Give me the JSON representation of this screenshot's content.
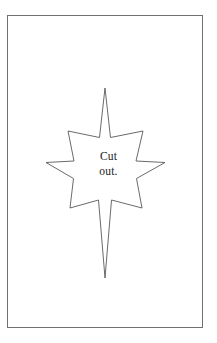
{
  "page": {
    "width": 217,
    "height": 343,
    "background_color": "#ffffff",
    "border_color": "#6f7072"
  },
  "frame": {
    "name": "page-border",
    "left": 7,
    "top": 15,
    "width": 196,
    "height": 313
  },
  "star": {
    "icon_name": "eight-pointed-bethlehem-star",
    "outline_color": "#58595b",
    "fill_color": "#ffffff",
    "stroke_width": 0.9,
    "center_x": 105,
    "center_y": 170,
    "top_tip_y": 88,
    "bottom_tip_y": 278,
    "left_tip_x": 46,
    "right_tip_x": 165,
    "points": 8,
    "path": "M105,88 L110.5,137.5 L143,131 L136,161 L165,162.5 L136.5,178.5 L142,208 L111.5,200 L105,278 L98.5,200 L70,208 L73.5,178.5 L46,162.5 L74,161 L68,131 L99.5,137.5 Z"
  },
  "label": {
    "line1": "Cut",
    "line2": "out.",
    "full_text": "Cut out.",
    "color": "#1b1b1b",
    "font_size_px": 11.5
  }
}
